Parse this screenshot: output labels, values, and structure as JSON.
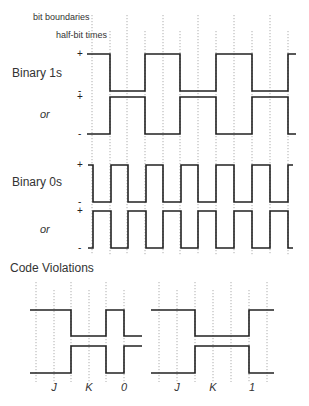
{
  "legend": {
    "bit_boundaries": "bit boundaries",
    "half_bit_times": "half-bit times"
  },
  "sections": {
    "binary1": {
      "label": "Binary 1s",
      "alt_label": "or"
    },
    "binary0": {
      "label": "Binary 0s",
      "alt_label": "or"
    },
    "violations": {
      "label": "Code Violations"
    }
  },
  "signs": {
    "plus": "+",
    "minus": "-"
  },
  "grid_top": {
    "bit_boundaries_x": [
      92,
      127,
      163,
      198,
      234,
      270
    ],
    "half_bit_x": [
      110,
      145,
      180,
      216,
      252,
      288
    ]
  },
  "waves": {
    "binary1_a": {
      "high": 54,
      "low": 91,
      "start": 87,
      "end": 296,
      "start_level": "high",
      "transitions": [
        110,
        145,
        180,
        216,
        252,
        288
      ]
    },
    "binary1_b": {
      "high": 97,
      "low": 134,
      "start": 87,
      "end": 296,
      "start_level": "low",
      "transitions": [
        110,
        145,
        180,
        216,
        252,
        288
      ]
    },
    "binary0_a": {
      "high": 165,
      "low": 202,
      "start": 88,
      "end": 293,
      "start_level": "high",
      "transitions": [
        93,
        111,
        128,
        146,
        163,
        181,
        198,
        216,
        234,
        252,
        270,
        288
      ]
    },
    "binary0_b": {
      "high": 211,
      "low": 248,
      "start": 88,
      "end": 293,
      "start_level": "low",
      "transitions": [
        93,
        111,
        128,
        146,
        163,
        181,
        198,
        216,
        234,
        252,
        270,
        288
      ]
    }
  },
  "violations": {
    "left": {
      "bit_boundaries_x": [
        36,
        71,
        106
      ],
      "half_bit_x": [
        54,
        89,
        124
      ],
      "wave_a": {
        "high": 310,
        "low": 336,
        "start": 30,
        "end": 142,
        "start_level": "high",
        "transitions": [
          71,
          106,
          124
        ]
      },
      "wave_b": {
        "high": 346,
        "low": 373,
        "start": 30,
        "end": 142,
        "start_level": "low",
        "transitions": [
          71,
          106,
          124
        ]
      },
      "symbols": [
        {
          "text": "J",
          "x": 54
        },
        {
          "text": "K",
          "x": 89
        },
        {
          "text": "0",
          "x": 124
        }
      ]
    },
    "right": {
      "bit_boundaries_x": [
        159,
        195,
        231,
        267
      ],
      "half_bit_x": [
        177,
        213,
        249
      ],
      "wave_a": {
        "high": 310,
        "low": 336,
        "start": 151,
        "end": 274,
        "start_level": "high",
        "transitions": [
          195,
          249
        ]
      },
      "wave_b": {
        "high": 346,
        "low": 373,
        "start": 151,
        "end": 274,
        "start_level": "low",
        "transitions": [
          195,
          249
        ]
      },
      "symbols": [
        {
          "text": "J",
          "x": 177
        },
        {
          "text": "K",
          "x": 213
        },
        {
          "text": "1",
          "x": 252
        }
      ]
    }
  },
  "colors": {
    "line": "#222222",
    "grid": "#999999",
    "text": "#333333"
  }
}
